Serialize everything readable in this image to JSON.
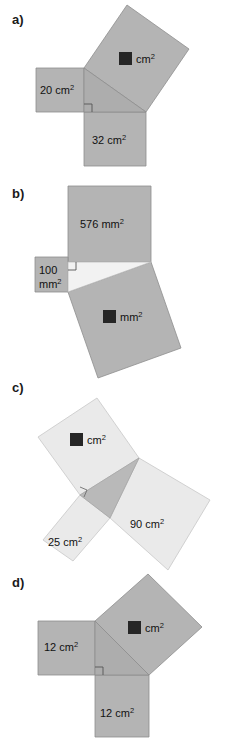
{
  "colors": {
    "square_gray": "#b4b4b4",
    "square_light": "#eaeaea",
    "triangle_gray": "#adadad",
    "triangle_light": "#f2f2f2",
    "triangle_dark": "#b9b9b9",
    "outline": "#8e8e8e",
    "outline_light": "#c8c8c8",
    "text": "#111111",
    "unknown_box": "#262626",
    "background": "#ffffff"
  },
  "figures": [
    {
      "label": "a)",
      "unit": "cm",
      "squares": [
        {
          "name": "left-square",
          "area": "20 cm",
          "sup": "2",
          "known": true
        },
        {
          "name": "bottom-square",
          "area": "32 cm",
          "sup": "2",
          "known": true
        },
        {
          "name": "hypotenuse-square",
          "area": "",
          "sup": "2",
          "unit_label": "cm",
          "known": false
        }
      ],
      "right_angle_marked": true
    },
    {
      "label": "b)",
      "unit": "mm",
      "squares": [
        {
          "name": "top-square",
          "area": "576 mm",
          "sup": "2",
          "known": true
        },
        {
          "name": "left-square",
          "area": "100",
          "area_line2": "mm",
          "sup": "2",
          "known": true
        },
        {
          "name": "hypotenuse-square",
          "area": "",
          "sup": "2",
          "unit_label": "mm",
          "known": false
        }
      ],
      "right_angle_marked": true
    },
    {
      "label": "c)",
      "unit": "cm",
      "squares": [
        {
          "name": "upper-left-square",
          "area": "",
          "sup": "2",
          "unit_label": "cm",
          "known": false
        },
        {
          "name": "lower-left-square",
          "area": "25 cm",
          "sup": "2",
          "known": true
        },
        {
          "name": "right-square",
          "area": "90 cm",
          "sup": "2",
          "known": true
        }
      ],
      "right_angle_marked": true
    },
    {
      "label": "d)",
      "unit": "cm",
      "squares": [
        {
          "name": "left-square",
          "area": "12 cm",
          "sup": "2",
          "known": true
        },
        {
          "name": "bottom-square",
          "area": "12 cm",
          "sup": "2",
          "known": true
        },
        {
          "name": "hypotenuse-square",
          "area": "",
          "sup": "2",
          "unit_label": "cm",
          "known": false
        }
      ],
      "right_angle_marked": true
    }
  ],
  "labels": {
    "a": "a)",
    "b": "b)",
    "c": "c)",
    "d": "d)",
    "a_left": "20 cm",
    "a_bottom": "32 cm",
    "a_unknown_unit": "cm",
    "b_top": "576 mm",
    "b_left_l1": "100",
    "b_left_l2": "mm",
    "b_unknown_unit": "mm",
    "c_unknown_unit": "cm",
    "c_lower": "25 cm",
    "c_right": "90 cm",
    "d_left": "12 cm",
    "d_bottom": "12 cm",
    "d_unknown_unit": "cm",
    "sup2": "2"
  }
}
